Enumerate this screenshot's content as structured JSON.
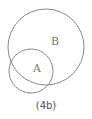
{
  "diagram": {
    "type": "venn",
    "caption": "(4b)",
    "stroke_color": "#8a8a8a",
    "sets": [
      {
        "label": "B",
        "cx": 46,
        "cy": 47,
        "r": 38,
        "label_x": 55,
        "label_y": 45
      },
      {
        "label": "A",
        "cx": 31,
        "cy": 71,
        "r": 22,
        "label_x": 37,
        "label_y": 72
      }
    ]
  }
}
